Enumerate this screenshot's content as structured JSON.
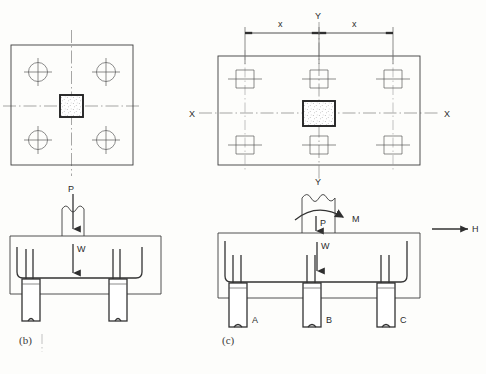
{
  "figure": {
    "captions": [
      {
        "id": "caption-b",
        "text": "(b)"
      },
      {
        "id": "caption-c",
        "text": "(c)"
      }
    ]
  },
  "panel_b": {
    "name": "Four-pile group, axial load only",
    "plan": {
      "pile_count": 4,
      "pile_symbol": "circle-with-crosshair",
      "cap_shape": "square",
      "column_symbol": "hatched-square"
    },
    "elevation": {
      "pile_count": 2,
      "loads": [
        {
          "label": "P",
          "type": "axial-point-load",
          "direction": "down"
        },
        {
          "label": "W",
          "type": "self-weight",
          "direction": "down"
        }
      ]
    }
  },
  "panel_c": {
    "name": "Six-pile group with moment and horizontal load",
    "plan": {
      "pile_count": 6,
      "pile_symbol": "square-with-crosshair",
      "cap_shape": "rectangle",
      "column_symbol": "hatched-square",
      "axis_labels": {
        "x_left": "X",
        "x_right": "X",
        "y_top": "Y",
        "y_bottom": "Y"
      },
      "dimensions": [
        {
          "label": "x",
          "side": "left"
        },
        {
          "label": "x",
          "side": "right"
        }
      ]
    },
    "elevation": {
      "pile_count": 3,
      "pile_labels": [
        "A",
        "B",
        "C"
      ],
      "loads": [
        {
          "label": "P",
          "type": "axial-point-load",
          "direction": "down"
        },
        {
          "label": "M",
          "type": "moment",
          "direction": "clockwise"
        },
        {
          "label": "W",
          "type": "self-weight",
          "direction": "down"
        },
        {
          "label": "H",
          "type": "horizontal-load",
          "direction": "right"
        }
      ]
    }
  },
  "colors": {
    "line": "#3c3c3c",
    "line_heavy": "#232323",
    "centerline": "#808080",
    "text": "#2b2b2b",
    "background": "#fdfdfb"
  }
}
